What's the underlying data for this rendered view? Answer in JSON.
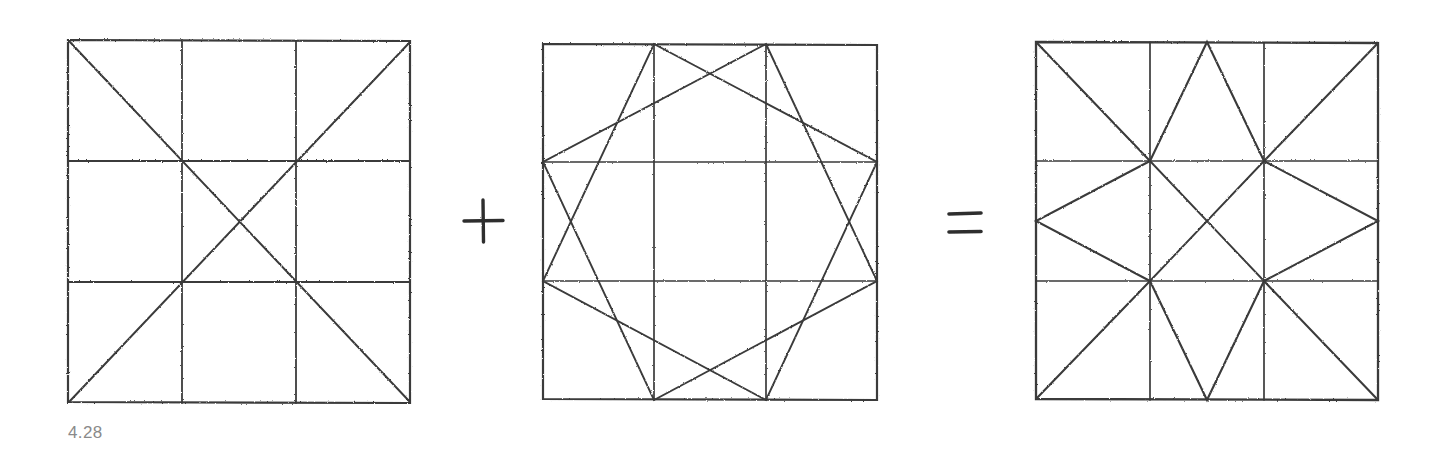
{
  "figure": {
    "caption": "4.28",
    "caption_color": "#8a8a8a",
    "background": "#ffffff",
    "ink_color": "#3a3a3a",
    "equation": {
      "operator_plus": "+",
      "operator_equals": "="
    },
    "panels": [
      {
        "name": "base-grid-with-diagonals",
        "label": "",
        "box": {
          "x": 68,
          "y": 40,
          "w": 342,
          "h": 363
        },
        "grid_divisions": 3,
        "elements": [
          "outer-square",
          "two-vertical-grid-lines",
          "two-horizontal-grid-lines",
          "diagonal-tl-br",
          "diagonal-tr-bl"
        ]
      },
      {
        "name": "eight-point-star-overlay",
        "label": "",
        "box": {
          "x": 543,
          "y": 44,
          "w": 334,
          "h": 356
        },
        "grid_divisions": 3,
        "elements": [
          "outer-square",
          "two-vertical-grid-lines",
          "two-horizontal-grid-lines",
          "eight-pointed-star-polygon"
        ]
      },
      {
        "name": "resulting-star-pattern",
        "label": "",
        "box": {
          "x": 1036,
          "y": 42,
          "w": 342,
          "h": 358
        },
        "grid_divisions": 3,
        "elements": [
          "outer-square",
          "two-vertical-grid-lines",
          "two-horizontal-grid-lines",
          "corner-diagonals",
          "center-diamond",
          "center-cross",
          "edge-chevrons"
        ]
      }
    ],
    "operators": [
      {
        "name": "plus-operator",
        "symbol": "+",
        "x": 478,
        "y": 220
      },
      {
        "name": "equals-operator",
        "symbol": "=",
        "x": 963,
        "y": 222
      }
    ]
  }
}
